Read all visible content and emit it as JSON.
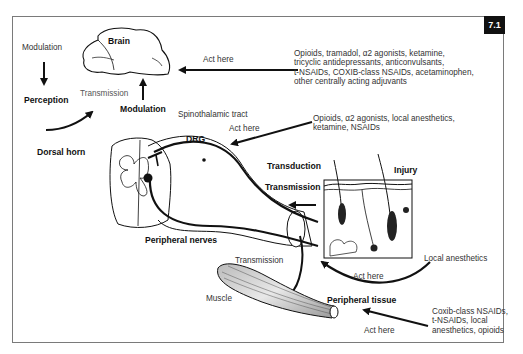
{
  "figure": {
    "number": "7.1"
  },
  "labels": {
    "modulation_top": "Modulation",
    "perception": "Perception",
    "brain": "Brain",
    "transmission_brain": "Transmission",
    "modulation_center": "Modulation",
    "spinothalamic_tract": "Spinothalamic tract",
    "dorsal_horn": "Dorsal horn",
    "drg": "DRG",
    "transduction": "Transduction",
    "transmission_skin": "Transmission",
    "injury": "Injury",
    "peripheral_nerves": "Peripheral nerves",
    "transmission_muscle": "Transmission",
    "muscle": "Muscle",
    "peripheral_tissue": "Peripheral tissue"
  },
  "drug_targets": [
    {
      "site": "Brain",
      "act_label": "Act here",
      "drugs": "Opioids, tramadol, α2 agonists, ketamine,\ntricyclic antidepressants, anticonvulsants,\nt-NSAIDs, COXIB-class NSAIDs, acetaminophen,\nother centrally acting adjuvants"
    },
    {
      "site": "DRG / Dorsal horn",
      "act_label": "Act here",
      "drugs": "Opioids, α2 agonists, local anesthetics,\nketamine, NSAIDs"
    },
    {
      "site": "Peripheral nerves",
      "act_label": "Act here",
      "drugs": "Local anesthetics"
    },
    {
      "site": "Peripheral tissue",
      "act_label": "Act here",
      "drugs": "Coxib-class NSAIDs,\nt-NSAIDs, local\nanesthetics, opioids"
    }
  ],
  "colors": {
    "frame": "#7a7a7a",
    "badge_bg": "#111111",
    "badge_text": "#ffffff",
    "line": "#111111",
    "text": "#333333"
  }
}
